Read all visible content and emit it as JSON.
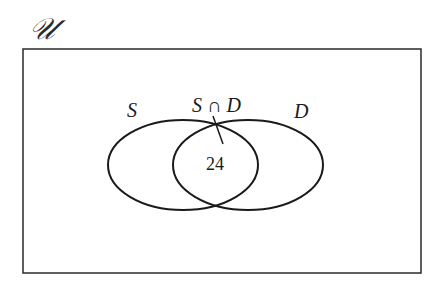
{
  "diagram": {
    "type": "venn",
    "universe": {
      "label": "𝒰",
      "rect": {
        "x": 23,
        "y": 49,
        "width": 398,
        "height": 224
      }
    },
    "sets": [
      {
        "id": "S",
        "label": "S",
        "ellipse": {
          "cx": 183,
          "cy": 165,
          "rx": 75,
          "ry": 45
        }
      },
      {
        "id": "D",
        "label": "D",
        "ellipse": {
          "cx": 248,
          "cy": 165,
          "rx": 75,
          "ry": 45
        }
      }
    ],
    "intersection": {
      "label": "S ∩ D",
      "count": "24",
      "pointer": {
        "x1": 213,
        "y1": 116,
        "x2": 223,
        "y2": 144
      }
    },
    "colors": {
      "stroke": "#1a1a1a",
      "background": "#ffffff"
    }
  }
}
